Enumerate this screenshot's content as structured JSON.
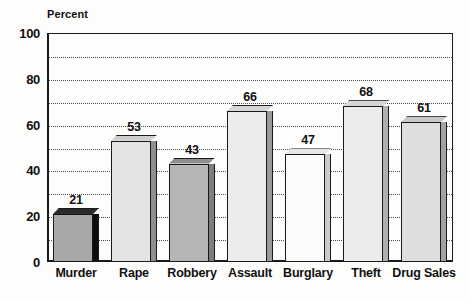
{
  "chart_data": {
    "type": "bar",
    "title": "",
    "subtitle": "",
    "xlabel": "",
    "ylabel": "Percent",
    "categories": [
      "Murder",
      "Rape",
      "Robbery",
      "Assault",
      "Burglary",
      "Theft",
      "Drug Sales"
    ],
    "values": [
      21,
      53,
      43,
      66,
      47,
      68,
      61
    ],
    "value_labels": [
      "21",
      "53",
      "43",
      "66",
      "47",
      "68",
      "61"
    ],
    "ylim": [
      0,
      100
    ],
    "ytick_labels": [
      "0",
      "20",
      "40",
      "60",
      "80",
      "100"
    ],
    "ytick_values": [
      0,
      20,
      40,
      60,
      80,
      100
    ],
    "gridline_values": [
      10,
      20,
      30,
      40,
      50,
      60,
      70,
      80,
      90
    ],
    "grid": true,
    "grid_style": "dotted",
    "legend": false,
    "legend_position": "none",
    "style": "3d-isometric",
    "bar_fills": [
      "#a8a8a8",
      "#e3e3e1",
      "#b5b5b5",
      "#ececea",
      "#fbfbf9",
      "#ececea",
      "#dededc"
    ],
    "bar_side_fills": [
      "#0d0d0d",
      "#8f8f8f",
      "#7d7d7d",
      "#9a9a9a",
      "#c9c9c7",
      "#b0b0ae",
      "#a2a2a0"
    ],
    "bar_top_fills": [
      "#2b2b2b",
      "#cfcfcd",
      "#8e8e8e",
      "#d6d6d4",
      "#e6e6e4",
      "#d6d6d4",
      "#c8c8c6"
    ],
    "outline_color": "#1a1a1a",
    "background_color": "#fdfdfb"
  },
  "colors": {
    "axis": "#1a1a1a",
    "grid": "#4a4a4a",
    "text": "#111111",
    "background": "#fdfdfb"
  }
}
